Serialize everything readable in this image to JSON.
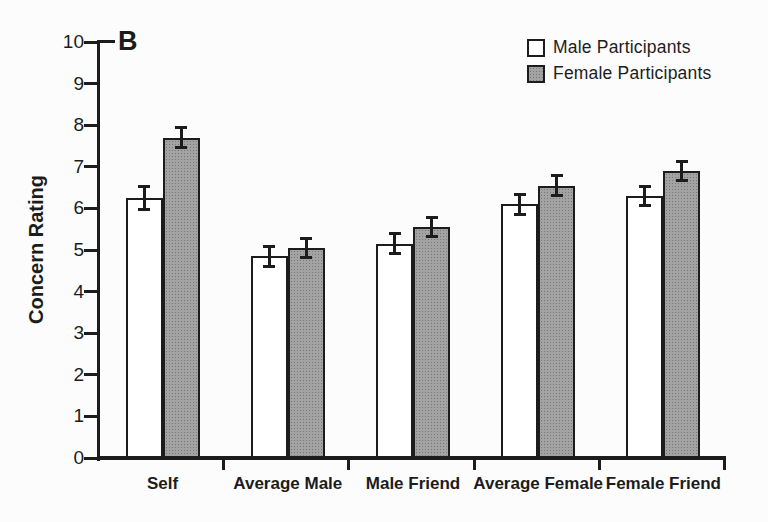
{
  "figure": {
    "panel_label": "B"
  },
  "chart_data": {
    "type": "bar",
    "title": "",
    "xlabel": "",
    "ylabel": "Concern Rating",
    "ylim": [
      0,
      10
    ],
    "ytick_step": 1,
    "grid": false,
    "legend_position": "top-right",
    "error_bars": true,
    "categories": [
      "Self",
      "Average Male",
      "Male Friend",
      "Average Female",
      "Female Friend"
    ],
    "series": [
      {
        "name": "Male Participants",
        "fill": "white",
        "values": [
          6.25,
          4.85,
          5.15,
          6.1,
          6.3
        ],
        "errors": [
          0.25,
          0.2,
          0.2,
          0.2,
          0.2
        ]
      },
      {
        "name": "Female Participants",
        "fill": "gray-halftone",
        "values": [
          7.7,
          5.05,
          5.55,
          6.55,
          6.9
        ],
        "errors": [
          0.2,
          0.2,
          0.2,
          0.2,
          0.2
        ]
      }
    ]
  },
  "colors": {
    "background": "#fcfcfc",
    "ink": "#1c1c1c",
    "bar_white_fill": "#ffffff",
    "bar_gray_fill": "#a3a3a3",
    "bar_gray_dot": "#787878"
  }
}
